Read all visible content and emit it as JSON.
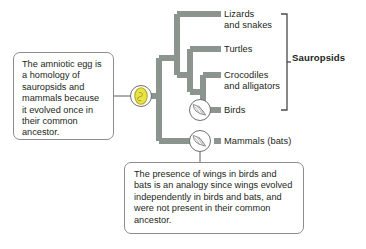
{
  "figure": {
    "background": "#ffffff"
  },
  "colors": {
    "branch": "#8b948f",
    "branch_dark": "#7d8781",
    "text": "#231f20",
    "callout_border": "#8d8d8d",
    "bracket": "#4a4a4a",
    "egg_fill": "#e9e34a",
    "egg_outline": "#b8a81f",
    "icon_circle_stroke": "#6f6f6f",
    "leader_line": "#5a5a5a"
  },
  "tree": {
    "taxa": [
      {
        "id": "lizards",
        "label": "Lizards\nand snakes",
        "tip_y": 14,
        "in_clade": true
      },
      {
        "id": "turtles",
        "label": "Turtles",
        "tip_y": 49,
        "in_clade": true
      },
      {
        "id": "crocs",
        "label": "Crocodiles\nand alligators",
        "tip_y": 75,
        "in_clade": true
      },
      {
        "id": "birds",
        "label": "Birds",
        "tip_y": 110,
        "in_clade": true
      },
      {
        "id": "mammals",
        "label": "Mammals (bats)",
        "tip_y": 141,
        "in_clade": false
      }
    ],
    "clade": {
      "id": "sauropsids",
      "label": "Sauropsids",
      "bracket_top": 14,
      "bracket_bottom": 110
    }
  },
  "markers": {
    "egg": {
      "name": "amniotic-egg",
      "icon": "egg-icon",
      "x": 141,
      "y": 96
    },
    "wing_birds": {
      "name": "wings-birds",
      "icon": "wing-icon",
      "x": 200,
      "y": 110
    },
    "wing_mammals": {
      "name": "wings-mammals",
      "icon": "wing-icon",
      "x": 200,
      "y": 141
    }
  },
  "callouts": {
    "amniotic_egg": {
      "text": "The amniotic egg is a homology of sauropsids and mammals because it evolved once in their common ancestor."
    },
    "wings_analogy": {
      "text": "The presence of wings in birds and bats is an analogy since wings evolved independently in birds and bats, and were not present in their common ancestor."
    }
  }
}
